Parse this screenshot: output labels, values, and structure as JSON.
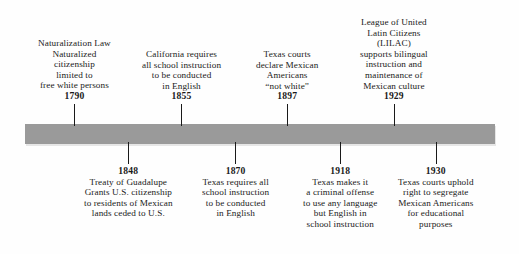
{
  "figure": {
    "kind": "historical-timeline",
    "background_color": "#fefefe",
    "bar_color": "#9a9a9a",
    "text_color": "#1a1a1a"
  },
  "events_above": [
    {
      "year": "1790",
      "tick_x": 74,
      "lines": [
        "Naturalization Law",
        "Naturalized",
        "citizenship",
        "limited to",
        "free white persons"
      ]
    },
    {
      "year": "1855",
      "tick_x": 181,
      "lines": [
        "California requires",
        "all school instruction",
        "to be conducted",
        "in English"
      ]
    },
    {
      "year": "1897",
      "tick_x": 287,
      "lines": [
        "Texas courts",
        "declare Mexican",
        "Americans",
        "“not white”"
      ]
    },
    {
      "year": "1929",
      "tick_x": 394,
      "lines": [
        "League of United",
        "Latin Citizens",
        "(LILAC)",
        "supports bilingual",
        "instruction and",
        "maintenance of",
        "Mexican culture"
      ]
    }
  ],
  "events_below": [
    {
      "year": "1848",
      "tick_x": 128,
      "lines": [
        "Treaty of Guadalupe",
        "Grants U.S. citizenship",
        "to residents of Mexican",
        "lands ceded to U.S."
      ]
    },
    {
      "year": "1870",
      "tick_x": 235,
      "lines": [
        "Texas requires all",
        "school instruction",
        "to be conducted",
        "in English"
      ]
    },
    {
      "year": "1918",
      "tick_x": 340,
      "lines": [
        "Texas makes it",
        "a criminal offense",
        "to use any language",
        "but English in",
        "school instruction"
      ]
    },
    {
      "year": "1930",
      "tick_x": 436,
      "lines": [
        "Texas courts uphold",
        "right to segregate",
        "Mexican Americans",
        "for educational",
        "purposes"
      ]
    }
  ]
}
